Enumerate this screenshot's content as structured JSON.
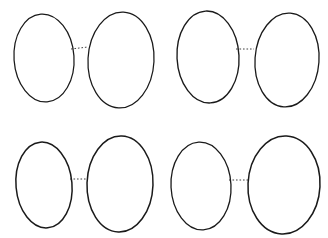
{
  "figure": {
    "type": "scientific-illustration",
    "background_color": "#ffffff",
    "ink_color": "#1a1a1a",
    "width": 328,
    "height": 238,
    "pair_count": 4,
    "egg_count": 8
  },
  "pairs": [
    {
      "id": "pair-top-left",
      "name": "speckled-pair",
      "pattern": "fine dark speckles scattered over whole shell, denser toward blunt end",
      "connector": {
        "x1": 71,
        "y1": 49,
        "x2": 88,
        "y2": 47,
        "style": "dotted"
      },
      "eggs": [
        {
          "id": "egg-1",
          "position": "left",
          "cx": 44,
          "cy": 58,
          "rx": 30,
          "ry": 44,
          "tilt": -4,
          "ground_color": "#ffffff",
          "speckle_color": "#1a1a1a",
          "speckle_density": "medium",
          "speckle_size": "small-to-medium",
          "shading": "stippled band low-left and base"
        },
        {
          "id": "egg-2",
          "position": "right",
          "cx": 121,
          "cy": 60,
          "rx": 33,
          "ry": 48,
          "tilt": 3,
          "ground_color": "#ffffff",
          "speckle_color": "#1a1a1a",
          "speckle_density": "medium",
          "speckle_size": "small-to-medium",
          "shading": "stippled band along right edge and base"
        }
      ]
    },
    {
      "id": "pair-top-right",
      "name": "blotched-pair",
      "pattern": "bold irregular black blotches with grey underspots",
      "connector": {
        "x1": 236,
        "y1": 49,
        "x2": 254,
        "y2": 49,
        "style": "dotted"
      },
      "eggs": [
        {
          "id": "egg-3",
          "position": "left",
          "cx": 208,
          "cy": 57,
          "rx": 31,
          "ry": 46,
          "tilt": -3,
          "ground_color": "#ffffff",
          "speckle_color": "#111111",
          "speckle_density": "sparse-large",
          "speckle_size": "large-blotch",
          "shading": "heavy stipple lower-left"
        },
        {
          "id": "egg-4",
          "position": "right",
          "cx": 287,
          "cy": 60,
          "rx": 32,
          "ry": 47,
          "tilt": 4,
          "ground_color": "#ffffff",
          "speckle_color": "#111111",
          "speckle_density": "sparse-large",
          "speckle_size": "large-blotch",
          "shading": "dark confluent blotch across middle, stipple at base"
        }
      ]
    },
    {
      "id": "pair-bottom-left",
      "name": "plain-pair",
      "pattern": "unmarked pale shell with soft stippled shading only",
      "connector": {
        "x1": 70,
        "y1": 179,
        "x2": 88,
        "y2": 179,
        "style": "dotted"
      },
      "eggs": [
        {
          "id": "egg-5",
          "position": "left",
          "cx": 44,
          "cy": 185,
          "rx": 28,
          "ry": 43,
          "tilt": -5,
          "ground_color": "#ffffff",
          "speckle_color": "none",
          "speckle_density": "none",
          "speckle_size": "none",
          "shading": "graded stipple lower-right and base"
        },
        {
          "id": "egg-6",
          "position": "right",
          "cx": 120,
          "cy": 184,
          "rx": 33,
          "ry": 48,
          "tilt": 2,
          "ground_color": "#ffffff",
          "speckle_color": "none",
          "speckle_density": "none",
          "speckle_size": "none",
          "shading": "graded stipple right flank and base"
        }
      ]
    },
    {
      "id": "pair-bottom-right",
      "name": "stippled-pair",
      "pattern": "dense fine dark stippling over entire surface",
      "connector": {
        "x1": 229,
        "y1": 180,
        "x2": 249,
        "y2": 180,
        "style": "dotted"
      },
      "eggs": [
        {
          "id": "egg-7",
          "position": "left",
          "cx": 201,
          "cy": 186,
          "rx": 30,
          "ry": 44,
          "tilt": -3,
          "ground_color": "#ffffff",
          "speckle_color": "#141414",
          "speckle_density": "very-dense",
          "speckle_size": "tiny-dash",
          "shading": "uniform dense stipple, darkest at margins"
        },
        {
          "id": "egg-8",
          "position": "right",
          "cx": 284,
          "cy": 185,
          "rx": 36,
          "ry": 49,
          "tilt": 3,
          "ground_color": "#ffffff",
          "speckle_color": "#0d0d0d",
          "speckle_density": "saturated",
          "speckle_size": "tiny-dash",
          "shading": "near-solid dark stipple overall"
        }
      ]
    }
  ]
}
